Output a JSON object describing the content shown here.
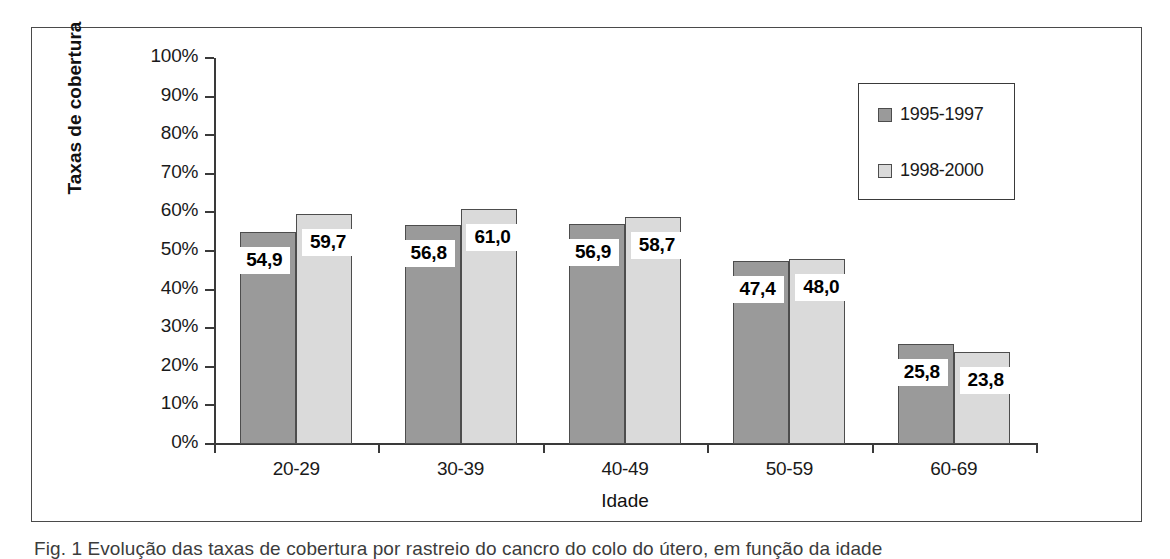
{
  "chart_data": {
    "type": "bar",
    "title": "",
    "xlabel": "Idade",
    "ylabel": "Taxas de cobertura",
    "categories": [
      "20-29",
      "30-39",
      "40-49",
      "50-59",
      "60-69"
    ],
    "series": [
      {
        "name": "1995-1997",
        "color": "#9a9a9a",
        "values": [
          54.9,
          56.8,
          56.9,
          47.4,
          25.8
        ],
        "labels": [
          "54,9",
          "56,8",
          "56,9",
          "47,4",
          "25,8"
        ]
      },
      {
        "name": "1998-2000",
        "color": "#dadada",
        "values": [
          59.7,
          61.0,
          58.7,
          48.0,
          23.8
        ],
        "labels": [
          "59,7",
          "61,0",
          "58,7",
          "48,0",
          "23,8"
        ]
      }
    ],
    "ylim": [
      0,
      100
    ],
    "ytick_labels": [
      "100%",
      "90%",
      "80%",
      "70%",
      "60%",
      "50%",
      "40%",
      "30%",
      "20%",
      "10%",
      "0%"
    ],
    "ytick_values": [
      100,
      90,
      80,
      70,
      60,
      50,
      40,
      30,
      20,
      10,
      0
    ],
    "grid": false,
    "legend_position": "top-right"
  },
  "legend": {
    "entries": [
      {
        "label": "1995-1997"
      },
      {
        "label": "1998-2000"
      }
    ]
  },
  "caption": {
    "text": "Fig. 1 Evolução das taxas de cobertura por rastreio do cancro do colo do útero, em função da idade"
  }
}
